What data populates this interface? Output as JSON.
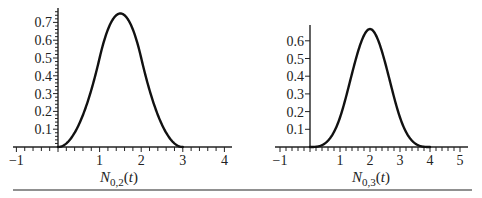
{
  "chart_data": [
    {
      "type": "line",
      "title": "",
      "xlabel": "N_{0,2}(t)",
      "xlabel_parts": {
        "main": "N",
        "sub": "0,2",
        "open": "(",
        "var": "t",
        "close": ")"
      },
      "ylabel": "",
      "xlim": [
        -1,
        4.1
      ],
      "ylim": [
        0,
        0.77
      ],
      "x_ticks": [
        -1,
        1,
        2,
        3,
        4
      ],
      "x_tick_labels": [
        "−1",
        "1",
        "2",
        "3",
        "4"
      ],
      "y_ticks": [
        0.1,
        0.2,
        0.3,
        0.4,
        0.5,
        0.6,
        0.7
      ],
      "y_tick_labels": [
        "0.1",
        "0.2",
        "0.3",
        "0.4",
        "0.5",
        "0.6",
        "0.7"
      ],
      "grid": false,
      "legend": null,
      "series": [
        {
          "name": "N_{0,2}(t)",
          "description": "quadratic B-spline basis function, support [0,3], peak 0.75 at t=1.5",
          "x": [
            0,
            0.25,
            0.5,
            0.75,
            1.0,
            1.25,
            1.5,
            1.75,
            2.0,
            2.25,
            2.5,
            2.75,
            3.0
          ],
          "y": [
            0,
            0.031,
            0.125,
            0.281,
            0.5,
            0.688,
            0.75,
            0.688,
            0.5,
            0.281,
            0.125,
            0.031,
            0
          ]
        }
      ]
    },
    {
      "type": "line",
      "title": "",
      "xlabel": "N_{0,3}(t)",
      "xlabel_parts": {
        "main": "N",
        "sub": "0,3",
        "open": "(",
        "var": "t",
        "close": ")"
      },
      "ylabel": "",
      "xlim": [
        -1,
        5.1
      ],
      "ylim": [
        0,
        0.69
      ],
      "x_ticks": [
        -1,
        1,
        2,
        3,
        4,
        5
      ],
      "x_tick_labels": [
        "−1",
        "1",
        "2",
        "3",
        "4",
        "5"
      ],
      "y_ticks": [
        0.1,
        0.2,
        0.3,
        0.4,
        0.5,
        0.6
      ],
      "y_tick_labels": [
        "0.1",
        "0.2",
        "0.3",
        "0.4",
        "0.5",
        "0.6"
      ],
      "grid": false,
      "legend": null,
      "series": [
        {
          "name": "N_{0,3}(t)",
          "description": "cubic B-spline basis function, support [0,4], peak 0.667 at t=2",
          "x": [
            0,
            0.5,
            1.0,
            1.5,
            2.0,
            2.5,
            3.0,
            3.5,
            4.0
          ],
          "y": [
            0,
            0.021,
            0.167,
            0.479,
            0.667,
            0.479,
            0.167,
            0.021,
            0
          ]
        }
      ]
    }
  ]
}
